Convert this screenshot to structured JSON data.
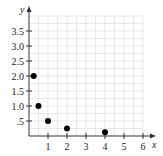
{
  "chart_data": {
    "type": "scatter",
    "title": "",
    "xlabel": "x",
    "ylabel": "y",
    "xlim": [
      0,
      6
    ],
    "ylim": [
      0,
      4
    ],
    "grid": true,
    "x_ticks": [
      1,
      2,
      3,
      4,
      5,
      6
    ],
    "x_tick_labels": [
      "1",
      "2",
      "3",
      "4",
      "5",
      "6"
    ],
    "y_ticks": [
      0.5,
      1.0,
      1.5,
      2.0,
      2.5,
      3.0,
      3.5
    ],
    "y_tick_labels": [
      ".5",
      "1.0",
      "1.5",
      "2.0",
      "2.5",
      "3.0",
      "3.5"
    ],
    "series": [
      {
        "name": "points",
        "x": [
          0.25,
          0.5,
          1,
          2,
          4
        ],
        "y": [
          2.0,
          1.0,
          0.5,
          0.25,
          0.125
        ]
      }
    ],
    "colors": {
      "point": "#000000",
      "axis": "#333333",
      "grid": "#d9d9d9"
    }
  }
}
